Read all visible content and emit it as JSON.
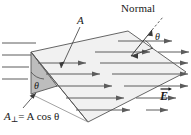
{
  "figure": {
    "type": "physics-diagram",
    "background_color": "#ffffff",
    "line_color": "#3a3a3a",
    "surface_fill": "#efefef",
    "perp_face_fill": "#bdbdbd",
    "labels": {
      "normal": "Normal",
      "area": "A",
      "theta_normal": "θ",
      "theta_face": "θ",
      "aperp_symbol": "A",
      "aperp_subscript": "⊥",
      "aperp_equation_rhs": "= A cos θ",
      "aperp_full": "A⊥ = A cos θ",
      "efield": "E"
    },
    "annotations": {
      "normal_leader": "dashed line from Normal text to normal vector",
      "area_leader": "arrow from A label to surface interior",
      "aperp_leader": "arrow from A-perp label to shaded vertical face"
    },
    "field": {
      "description": "uniform electric field, horizontal parallel lines pointing right",
      "direction": "right",
      "line_count": 14
    }
  }
}
